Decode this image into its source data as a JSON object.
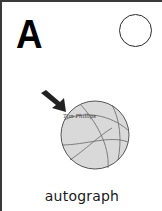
{
  "card": {
    "letter": "A",
    "word": "autograph",
    "illustration": {
      "subject": "basketball-icon",
      "signature_text": "Tim Phillips",
      "pointer": "arrow-icon"
    },
    "checkbox": "empty-circle"
  },
  "colors": {
    "border": "#3a3a3a",
    "ball_fill": "#d9d9d9",
    "ball_lines": "#555555",
    "text": "#1a1a1a"
  }
}
